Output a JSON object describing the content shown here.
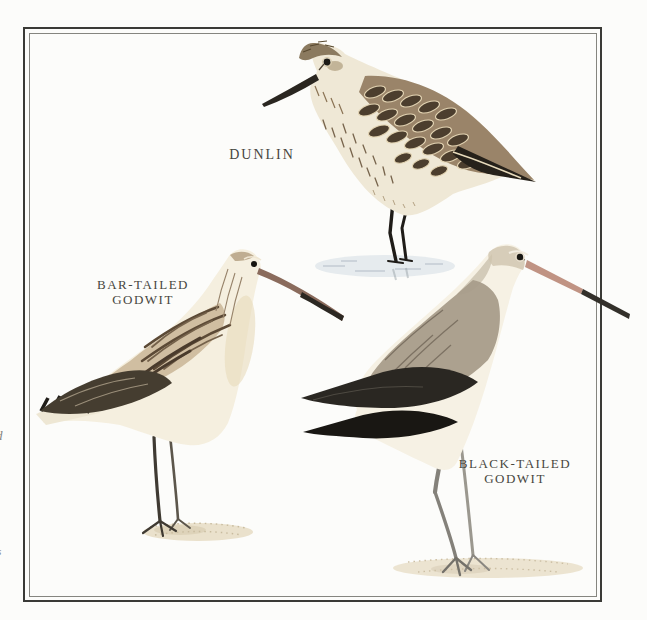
{
  "page": {
    "width_px": 647,
    "height_px": 620,
    "background_color": "#fcfcfa"
  },
  "frame": {
    "outer_border_color": "#3a3a36",
    "inner_border_color": "#85857f"
  },
  "labels": {
    "dunlin": {
      "line1": "DUNLIN"
    },
    "bar_tailed_godwit": {
      "line1": "BAR-TAILED",
      "line2": "GODWIT"
    },
    "black_tailed_godwit": {
      "line1": "BLACK-TAILED",
      "line2": "GODWIT"
    }
  },
  "margin_fragments": [
    {
      "text": "d"
    },
    {
      "text": "s"
    }
  ],
  "palette": {
    "label_text": "#47463e",
    "plumage_dark_brown": "#4c3e2e",
    "plumage_buff": "#cdbb98",
    "plumage_cream": "#f5efdf",
    "plumage_black": "#211e19",
    "plumage_gray": "#a89c8a",
    "bill_pink": "#bd9680",
    "leg_dark": "#3f3a32",
    "water_blue_gray": "#e4e9ec",
    "sand": "#eae1cc"
  }
}
